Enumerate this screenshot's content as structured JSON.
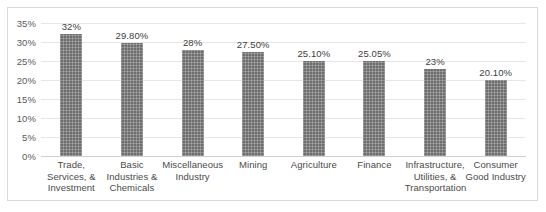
{
  "chart_data": {
    "type": "bar",
    "title": "",
    "subtitle": "",
    "xlabel": "",
    "ylabel": "",
    "ylim": [
      0,
      35
    ],
    "ytick_step": 5,
    "ytick_labels": [
      "35%",
      "30%",
      "25%",
      "20%",
      "15%",
      "10%",
      "5%",
      "0%"
    ],
    "ytick_values": [
      35,
      30,
      25,
      20,
      15,
      10,
      5,
      0
    ],
    "grid": true,
    "legend": "none",
    "orientation": "vertical",
    "bar_color": "#6e6e6e",
    "bar_pattern": "fine-dotted-crosshatch",
    "categories": [
      "Trade, Services, & Investment",
      "Basic Industries & Chemicals",
      "Miscellaneous Industry",
      "Mining",
      "Agriculture",
      "Finance",
      "Infrastructure, Utilities, & Transportation",
      "Consumer Good Industry"
    ],
    "category_lines": [
      [
        "Trade,",
        "Services, &",
        "Investment"
      ],
      [
        "Basic",
        "Industries &",
        "Chemicals"
      ],
      [
        "Miscellaneous",
        "Industry"
      ],
      [
        "Mining"
      ],
      [
        "Agriculture"
      ],
      [
        "Finance"
      ],
      [
        "Infrastructure,",
        "Utilities, &",
        "Transportation"
      ],
      [
        "Consumer",
        "Good Industry"
      ]
    ],
    "values": [
      32,
      29.8,
      28,
      27.5,
      25.1,
      25.05,
      23,
      20.1
    ],
    "data_labels": [
      "32%",
      "29.80%",
      "28%",
      "27.50%",
      "25.10%",
      "25.05%",
      "23%",
      "20.10%"
    ]
  },
  "colors": {
    "bar": "#6e6e6e",
    "grid": "#e6e6e6",
    "frame_border": "#d9d9d9",
    "tick_text": "#5a5a5a",
    "label_text": "#4a4a4a",
    "background": "#ffffff"
  }
}
